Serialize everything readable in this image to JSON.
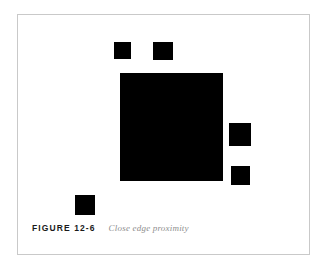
{
  "figure": {
    "caption_label": "FIGURE 12-6",
    "caption_text": "Close edge proximity",
    "frame_color": "#c9c9c9",
    "shape_color": "#000000",
    "background_color": "#ffffff",
    "caption_label_color": "#1a1a1a",
    "caption_text_color": "#8e8e8e",
    "shapes": [
      {
        "name": "small-square-top-left",
        "x": 96,
        "y": 27,
        "w": 17,
        "h": 17
      },
      {
        "name": "small-square-top-right",
        "x": 135,
        "y": 27,
        "w": 20,
        "h": 18
      },
      {
        "name": "large-square-center",
        "x": 102,
        "y": 58,
        "w": 103,
        "h": 108
      },
      {
        "name": "small-square-right-upper",
        "x": 211,
        "y": 108,
        "w": 22,
        "h": 23
      },
      {
        "name": "small-square-right-lower",
        "x": 213,
        "y": 151,
        "w": 19,
        "h": 19
      },
      {
        "name": "small-square-bottom-left",
        "x": 57,
        "y": 180,
        "w": 20,
        "h": 20
      }
    ]
  }
}
